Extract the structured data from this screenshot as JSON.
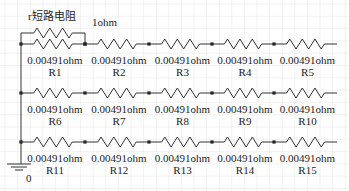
{
  "diagram": {
    "type": "circuit-schematic",
    "short_resistor": {
      "label": "r短路电阻",
      "value": "1ohm"
    },
    "ground_label": "0",
    "rows": [
      {
        "resistors": [
          {
            "name": "R1",
            "value": "0.00491ohm"
          },
          {
            "name": "R2",
            "value": "0.00491ohm"
          },
          {
            "name": "R3",
            "value": "0.00491ohm"
          },
          {
            "name": "R4",
            "value": "0.00491ohm"
          },
          {
            "name": "R5",
            "value": "0.00491ohm"
          }
        ]
      },
      {
        "resistors": [
          {
            "name": "R6",
            "value": "0.00491ohm"
          },
          {
            "name": "R7",
            "value": "0.00491ohm"
          },
          {
            "name": "R8",
            "value": "0.00491ohm"
          },
          {
            "name": "R9",
            "value": "0.00491ohm"
          },
          {
            "name": "R10",
            "value": "0.00491ohm"
          }
        ]
      },
      {
        "resistors": [
          {
            "name": "R11",
            "value": "0.00491ohm"
          },
          {
            "name": "R12",
            "value": "0.00491ohm"
          },
          {
            "name": "R13",
            "value": "0.00491ohm"
          },
          {
            "name": "R14",
            "value": "0.00491ohm"
          },
          {
            "name": "R15",
            "value": "0.00491ohm"
          }
        ]
      }
    ],
    "colors": {
      "wire": "#333333",
      "grid": "#e6e6e6",
      "background": "#ffffff",
      "text": "#222222"
    }
  }
}
